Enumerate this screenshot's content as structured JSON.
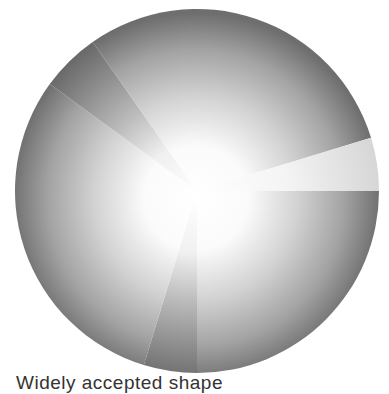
{
  "figure": {
    "caption": "Widely accepted shape"
  },
  "colors": {
    "background": "#ffffff",
    "rim": "#6e6e6e",
    "center_highlight": "#ffffff",
    "light_wedge": "#dcdcdc",
    "dark_wedge": "#7a7a7a",
    "caption_text": "#333333"
  },
  "chart_data": {
    "type": "pie",
    "title": "",
    "legend": [],
    "labels_visible": false,
    "center": [
      197,
      191
    ],
    "radius": 182,
    "start_angle_deg": 0,
    "direction": "clockwise-from-3-oclock",
    "slices": [
      {
        "name": "main-1",
        "start": 0,
        "end": 90,
        "degrees": 90,
        "tone": "gradient-gray"
      },
      {
        "name": "bottom-wedge",
        "start": 90,
        "end": 107,
        "degrees": 17,
        "tone": "darker-gray"
      },
      {
        "name": "main-2",
        "start": 107,
        "end": 216,
        "degrees": 109,
        "tone": "gradient-gray"
      },
      {
        "name": "upper-left-wedge",
        "start": 216,
        "end": 235,
        "degrees": 19,
        "tone": "darker-gray"
      },
      {
        "name": "main-3",
        "start": 235,
        "end": 343,
        "degrees": 108,
        "tone": "gradient-gray"
      },
      {
        "name": "right-light-wedge",
        "start": 343,
        "end": 360,
        "degrees": 17,
        "tone": "light-gray"
      }
    ],
    "values_percent": [
      25,
      4.7,
      30.3,
      5.3,
      30,
      4.7
    ],
    "grid": false,
    "shading": "radial gradient, white center fading to gray rim"
  }
}
